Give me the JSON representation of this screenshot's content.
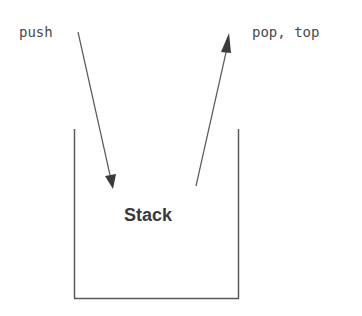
{
  "diagram": {
    "type": "stack-operations",
    "labels": {
      "push": "push",
      "pop_top": "pop, top",
      "container": "Stack"
    },
    "colors": {
      "stroke": "#5a5a5a",
      "arrowhead": "#3a3a3a",
      "text": "#4a4a4a",
      "background": "#ffffff"
    },
    "arrows": [
      {
        "name": "push-arrow",
        "from": "push",
        "to": "Stack",
        "direction": "into-stack"
      },
      {
        "name": "pop-arrow",
        "from": "Stack",
        "to": "pop, top",
        "direction": "out-of-stack"
      }
    ],
    "container_shape": "open-top box"
  }
}
